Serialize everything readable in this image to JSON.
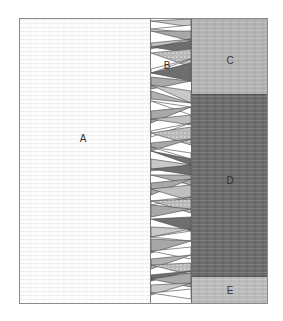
{
  "diagram": {
    "regions": {
      "a": {
        "label": "A",
        "color": "#fbfbfb"
      },
      "b": {
        "label": "B",
        "color": "#ffffff"
      },
      "c": {
        "label": "C",
        "color": "#b2b2b2"
      },
      "d": {
        "label": "D",
        "color": "#6c6c6c"
      },
      "e": {
        "label": "E",
        "color": "#bbbbbb"
      }
    },
    "strip_colors": {
      "light": "#c8c8c8",
      "medium": "#a8a8a8",
      "dark": "#6e6e6e",
      "dotted": "#b8b8b8",
      "outline": "#444444"
    }
  }
}
